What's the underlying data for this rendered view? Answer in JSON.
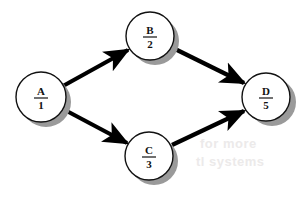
{
  "diagram": {
    "background_color": "#ffffff",
    "node_fill_color": "#ffffff",
    "node_stroke_color": "#111111",
    "node_shadow_color": "#9a9a9a",
    "edge_color": "#000000",
    "label_color": "#111111",
    "nodes": [
      {
        "id": "A",
        "letter": "A",
        "number": "1",
        "cx": 41,
        "cy": 97,
        "r": 25
      },
      {
        "id": "B",
        "letter": "B",
        "number": "2",
        "cx": 150,
        "cy": 36,
        "r": 24
      },
      {
        "id": "C",
        "letter": "C",
        "number": "3",
        "cx": 149,
        "cy": 156,
        "r": 24
      },
      {
        "id": "D",
        "letter": "D",
        "number": "5",
        "cx": 266,
        "cy": 97,
        "r": 24
      }
    ],
    "edges": [
      {
        "id": "A-B",
        "from": "A",
        "to": "B",
        "label": ""
      },
      {
        "id": "A-C",
        "from": "A",
        "to": "C",
        "label": ""
      },
      {
        "id": "B-D",
        "from": "B",
        "to": "D",
        "label": ""
      },
      {
        "id": "C-D",
        "from": "C",
        "to": "D",
        "label": ""
      }
    ],
    "artifacts": [
      {
        "id": "ghost-1",
        "text": "tl systems",
        "x": 196,
        "y": 166
      },
      {
        "id": "ghost-2",
        "text": "for more",
        "x": 200,
        "y": 148
      }
    ]
  }
}
